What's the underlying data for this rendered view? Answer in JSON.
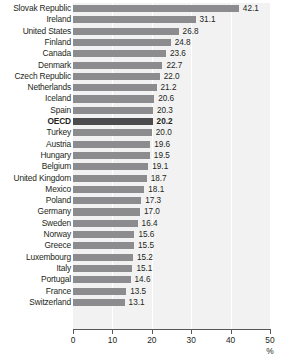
{
  "chart_data": {
    "type": "bar",
    "orientation": "horizontal",
    "title": "",
    "subtitle": "",
    "xlabel": "%",
    "ylabel": "",
    "xlim": [
      0,
      50
    ],
    "xticks": [
      0,
      10,
      20,
      30,
      40,
      50
    ],
    "grid": true,
    "legend": null,
    "highlight_category": "OECD",
    "colors": {
      "bar": "#8c8c8e",
      "bar_highlight": "#4c4c4e",
      "plot_background": "#f2f2f2",
      "gridline": "#ffffff",
      "axis": "#58585a",
      "text": "#231f20"
    },
    "categories": [
      "Slovak Republic",
      "Ireland",
      "United States",
      "Finland",
      "Canada",
      "Denmark",
      "Czech Republic",
      "Netherlands",
      "Iceland",
      "Spain",
      "OECD",
      "Turkey",
      "Austria",
      "Hungary",
      "Belgium",
      "United Kingdom",
      "Mexico",
      "Poland",
      "Germany",
      "Sweden",
      "Norway",
      "Greece",
      "Luxembourg",
      "Italy",
      "Portugal",
      "France",
      "Switzerland"
    ],
    "values": [
      42.1,
      31.1,
      26.8,
      24.8,
      23.6,
      22.7,
      22.0,
      21.2,
      20.6,
      20.3,
      20.2,
      20.0,
      19.6,
      19.5,
      19.1,
      18.7,
      18.1,
      17.3,
      17.0,
      16.4,
      15.6,
      15.5,
      15.2,
      15.1,
      14.6,
      13.5,
      13.1
    ],
    "value_labels": [
      "42.1",
      "31.1",
      "26.8",
      "24.8",
      "23.6",
      "22.7",
      "22.0",
      "21.2",
      "20.6",
      "20.3",
      "20.2",
      "20.0",
      "19.6",
      "19.5",
      "19.1",
      "18.7",
      "18.1",
      "17.3",
      "17.0",
      "16.4",
      "15.6",
      "15.5",
      "15.2",
      "15.1",
      "14.6",
      "13.5",
      "13.1"
    ],
    "xtick_labels": [
      "0",
      "10",
      "20",
      "30",
      "40",
      "50"
    ]
  }
}
